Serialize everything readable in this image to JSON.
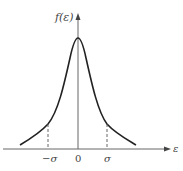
{
  "diagram": {
    "y_axis_label": "f(ε)",
    "x_axis_label": "ε",
    "ticks": [
      {
        "label": "−σ",
        "pos": "-sigma"
      },
      {
        "label": "0",
        "pos": "zero"
      },
      {
        "label": "σ",
        "pos": "sigma"
      }
    ],
    "curve": "bell-shaped (peaked, heavy tails) symmetric density",
    "markers": "dashed vertical lines at −σ and σ",
    "colors": {
      "axis": "#555555",
      "curve": "#222222",
      "text": "#444444"
    }
  }
}
